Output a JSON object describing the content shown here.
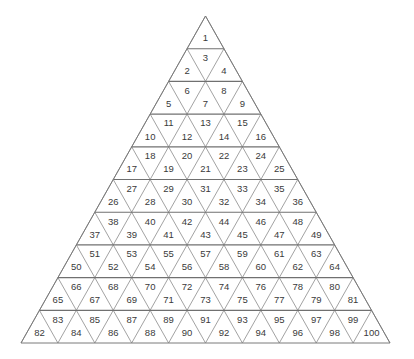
{
  "figure": {
    "shape": "equilateral-triangle",
    "rows": 10,
    "total_cells": 100,
    "background_color": "#ffffff",
    "line_color": "#8a8a8a",
    "row_divider_color": "#707070",
    "label_color": "#3a3a3a",
    "geometry": {
      "apex_x": 205.5,
      "apex_y": 16,
      "base_y": 343,
      "base_left_x": 21,
      "base_right_x": 390,
      "row_height": 32.7,
      "half_base_per_row": 18.45
    },
    "rows_data": [
      {
        "row": 1,
        "count": 1,
        "labels": [
          "1"
        ],
        "orientations": [
          "up"
        ]
      },
      {
        "row": 2,
        "count": 3,
        "labels": [
          "2",
          "3",
          "4"
        ],
        "orientations": [
          "up",
          "down",
          "up"
        ]
      },
      {
        "row": 3,
        "count": 5,
        "labels": [
          "5",
          "6",
          "7",
          "8",
          "9"
        ],
        "orientations": [
          "up",
          "down",
          "up",
          "down",
          "up"
        ]
      },
      {
        "row": 4,
        "count": 7,
        "labels": [
          "10",
          "11",
          "12",
          "13",
          "14",
          "15",
          "16"
        ],
        "orientations": [
          "up",
          "down",
          "up",
          "down",
          "up",
          "down",
          "up"
        ]
      },
      {
        "row": 5,
        "count": 9,
        "labels": [
          "17",
          "18",
          "19",
          "20",
          "21",
          "22",
          "23",
          "24",
          "25"
        ],
        "orientations": [
          "up",
          "down",
          "up",
          "down",
          "up",
          "down",
          "up",
          "down",
          "up"
        ]
      },
      {
        "row": 6,
        "count": 11,
        "labels": [
          "26",
          "27",
          "28",
          "29",
          "30",
          "31",
          "32",
          "33",
          "34",
          "35",
          "36"
        ],
        "orientations": [
          "up",
          "down",
          "up",
          "down",
          "up",
          "down",
          "up",
          "down",
          "up",
          "down",
          "up"
        ]
      },
      {
        "row": 7,
        "count": 13,
        "labels": [
          "37",
          "38",
          "39",
          "40",
          "41",
          "42",
          "43",
          "44",
          "45",
          "46",
          "47",
          "48",
          "49"
        ],
        "orientations": [
          "up",
          "down",
          "up",
          "down",
          "up",
          "down",
          "up",
          "down",
          "up",
          "down",
          "up",
          "down",
          "up"
        ]
      },
      {
        "row": 8,
        "count": 15,
        "labels": [
          "50",
          "51",
          "52",
          "53",
          "54",
          "55",
          "56",
          "57",
          "58",
          "59",
          "60",
          "61",
          "62",
          "63",
          "64"
        ],
        "orientations": [
          "up",
          "down",
          "up",
          "down",
          "up",
          "down",
          "up",
          "down",
          "up",
          "down",
          "up",
          "down",
          "up",
          "down",
          "up"
        ]
      },
      {
        "row": 9,
        "count": 17,
        "labels": [
          "65",
          "66",
          "67",
          "68",
          "69",
          "70",
          "71",
          "72",
          "73",
          "74",
          "75",
          "76",
          "77",
          "78",
          "79",
          "80",
          "81"
        ],
        "orientations": [
          "up",
          "down",
          "up",
          "down",
          "up",
          "down",
          "up",
          "down",
          "up",
          "down",
          "up",
          "down",
          "up",
          "down",
          "up",
          "down",
          "up"
        ]
      },
      {
        "row": 10,
        "count": 19,
        "labels": [
          "82",
          "83",
          "84",
          "85",
          "86",
          "87",
          "88",
          "89",
          "90",
          "91",
          "92",
          "93",
          "94",
          "95",
          "96",
          "97",
          "98",
          "99",
          "100"
        ],
        "orientations": [
          "up",
          "down",
          "up",
          "down",
          "up",
          "down",
          "up",
          "down",
          "up",
          "down",
          "up",
          "down",
          "up",
          "down",
          "up",
          "down",
          "up",
          "down",
          "up"
        ]
      }
    ]
  }
}
